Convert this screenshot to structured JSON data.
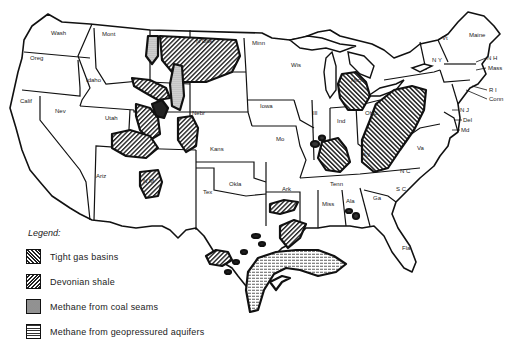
{
  "map": {
    "subject": "Unconventional natural gas resources of the contiguous United States",
    "state_labels": [
      {
        "id": "wash",
        "text": "Wash",
        "x": 51,
        "y": 35
      },
      {
        "id": "oreg",
        "text": "Oreg",
        "x": 30,
        "y": 60
      },
      {
        "id": "calif",
        "text": "Calif",
        "x": 20,
        "y": 103
      },
      {
        "id": "nev",
        "text": "Nev",
        "x": 55,
        "y": 113
      },
      {
        "id": "idaho",
        "text": "Idaho",
        "x": 86,
        "y": 82
      },
      {
        "id": "mont",
        "text": "Mont",
        "x": 102,
        "y": 36
      },
      {
        "id": "utah",
        "text": "Utah",
        "x": 105,
        "y": 120
      },
      {
        "id": "ariz",
        "text": "Ariz",
        "x": 96,
        "y": 178
      },
      {
        "id": "nmex",
        "text": "N M",
        "x": 143,
        "y": 183
      },
      {
        "id": "ndak",
        "text": "N Dak",
        "x": 196,
        "y": 43
      },
      {
        "id": "nebr",
        "text": "Nebr",
        "x": 192,
        "y": 115
      },
      {
        "id": "kans",
        "text": "Kans",
        "x": 210,
        "y": 151
      },
      {
        "id": "okla",
        "text": "Okla",
        "x": 229,
        "y": 186
      },
      {
        "id": "tex",
        "text": "Tex",
        "x": 203,
        "y": 194
      },
      {
        "id": "minn",
        "text": "Minn",
        "x": 252,
        "y": 45
      },
      {
        "id": "iowa",
        "text": "Iowa",
        "x": 260,
        "y": 108
      },
      {
        "id": "wis",
        "text": "Wis",
        "x": 291,
        "y": 67
      },
      {
        "id": "mo",
        "text": "Mo",
        "x": 276,
        "y": 141
      },
      {
        "id": "ark",
        "text": "Ark",
        "x": 282,
        "y": 191
      },
      {
        "id": "ill",
        "text": "Ill",
        "x": 313,
        "y": 115
      },
      {
        "id": "ind",
        "text": "Ind",
        "x": 337,
        "y": 123
      },
      {
        "id": "ohio",
        "text": "Ohio",
        "x": 365,
        "y": 115
      },
      {
        "id": "ky",
        "text": "Ky",
        "x": 363,
        "y": 156
      },
      {
        "id": "tenn",
        "text": "Tenn",
        "x": 330,
        "y": 186
      },
      {
        "id": "miss",
        "text": "Miss",
        "x": 322,
        "y": 206
      },
      {
        "id": "ala",
        "text": "Ala",
        "x": 346,
        "y": 203
      },
      {
        "id": "ga",
        "text": "Ga",
        "x": 373,
        "y": 200
      },
      {
        "id": "fla",
        "text": "Fla",
        "x": 402,
        "y": 250
      },
      {
        "id": "sc",
        "text": "S C",
        "x": 396,
        "y": 191
      },
      {
        "id": "nc",
        "text": "N C",
        "x": 400,
        "y": 173
      },
      {
        "id": "va",
        "text": "Va",
        "x": 417,
        "y": 150
      },
      {
        "id": "md",
        "text": "Md",
        "x": 461,
        "y": 132
      },
      {
        "id": "del",
        "text": "Del",
        "x": 463,
        "y": 122
      },
      {
        "id": "nj",
        "text": "N J",
        "x": 460,
        "y": 112
      },
      {
        "id": "ny",
        "text": "N Y",
        "x": 432,
        "y": 62
      },
      {
        "id": "vt",
        "text": "Vt",
        "x": 442,
        "y": 40
      },
      {
        "id": "maine",
        "text": "Maine",
        "x": 469,
        "y": 37
      },
      {
        "id": "nh",
        "text": "N H",
        "x": 487,
        "y": 60
      },
      {
        "id": "mass",
        "text": "Mass",
        "x": 488,
        "y": 70
      },
      {
        "id": "ri",
        "text": "R I",
        "x": 489,
        "y": 92
      },
      {
        "id": "conn",
        "text": "Conn",
        "x": 489,
        "y": 101
      },
      {
        "id": "mich",
        "text": "Mich",
        "x": 351,
        "y": 82
      }
    ]
  },
  "legend": {
    "title": "Legend:",
    "items": [
      {
        "id": "tight-gas",
        "label": "Tight gas basins",
        "pattern": "diagonal-forward-hatch"
      },
      {
        "id": "devonian",
        "label": "Devonian shale",
        "pattern": "diagonal-back-hatch"
      },
      {
        "id": "coal-seams",
        "label": "Methane from coal seams",
        "pattern": "stipple"
      },
      {
        "id": "geopressured",
        "label": "Methane from geopressured aquifers",
        "pattern": "horizontal-lines"
      }
    ]
  },
  "colors": {
    "ink": "#111111",
    "paper": "#ffffff"
  }
}
